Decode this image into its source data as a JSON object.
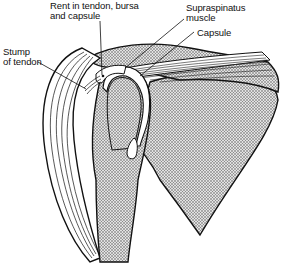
{
  "diagram": {
    "colors": {
      "outline": "#111111",
      "bone_fill": "#c8c8c8",
      "stipple": "#555555",
      "background": "#ffffff"
    },
    "labels": [
      {
        "id": "rent",
        "text": "Rent in tendon, bursa\nand capsule"
      },
      {
        "id": "supraspinatus",
        "text": "Supraspinatus\nmuscle"
      },
      {
        "id": "capsule",
        "text": "Capsule"
      },
      {
        "id": "stump",
        "text": "Stump\nof tendon"
      }
    ],
    "structures": [
      "humerus",
      "humeral-head",
      "scapula",
      "acromion",
      "deltoid-muscle",
      "supraspinatus-muscle",
      "capsule",
      "bursa",
      "tendon-stump"
    ]
  }
}
